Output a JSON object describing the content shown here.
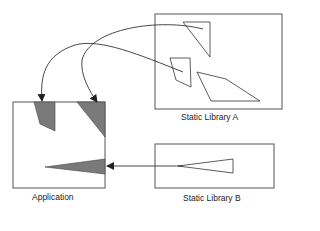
{
  "diagram": {
    "application": {
      "label": "Application"
    },
    "library_a": {
      "label": "Static Library A"
    },
    "library_b": {
      "label": "Static Library B"
    },
    "colors": {
      "stroke": "#333333",
      "fill": "#7a7a7a"
    }
  }
}
